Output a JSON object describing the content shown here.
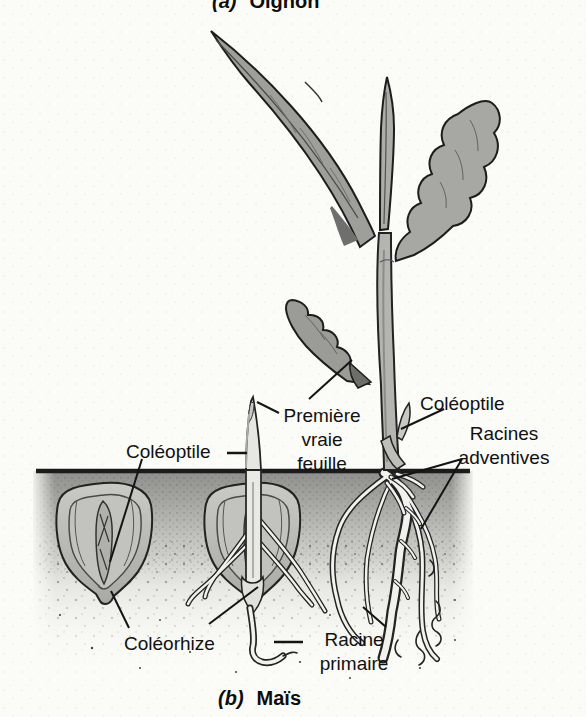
{
  "figure": {
    "type": "botanical-illustration",
    "caption_top": {
      "index": "(a)",
      "title": "Oignon"
    },
    "caption_bottom": {
      "index": "(b)",
      "title": "Maïs"
    },
    "labels": {
      "coleoptile_seed": "Coléoptile",
      "first_true_leaf": [
        "Première",
        "vraie feuille"
      ],
      "coleoptile_plant": "Coléoptile",
      "adventitious_roots": [
        "Racines",
        "adventives"
      ],
      "coleorhiza": "Coléorhize",
      "primary_root": [
        "Racine",
        "primaire"
      ]
    },
    "colors": {
      "paper": "#fbfbf8",
      "ink": "#1a1a1a",
      "leaf_gray": "#9e9e9b",
      "stem_gray": "#b4b4b1",
      "soil_dark": "#8f8f8d",
      "kernel_gray": "#bcbcb9",
      "root_highlight": "#f1f1ee"
    }
  }
}
